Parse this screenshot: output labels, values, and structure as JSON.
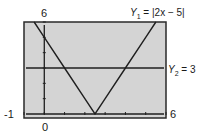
{
  "chart_data": {
    "type": "line",
    "title": "",
    "xlabel": "",
    "ylabel": "",
    "xlim": [
      -1,
      6
    ],
    "ylim": [
      0,
      6
    ],
    "grid": false,
    "tick_labels": {
      "y_max": "6",
      "x_min": "-1",
      "x_max": "6",
      "origin": "0"
    },
    "series": [
      {
        "name": "Y1 = |2x - 5|",
        "label_prefix": "Y",
        "label_sub": "1",
        "label_rest": " = |2x − 5|",
        "expression": "abs(2*x-5)",
        "x": [
          -0.5,
          0,
          1,
          2,
          2.5,
          3,
          4,
          5,
          5.5
        ],
        "y": [
          6,
          5,
          3,
          1,
          0,
          1,
          3,
          5,
          6
        ]
      },
      {
        "name": "Y2 = 3",
        "label_prefix": "Y",
        "label_sub": "2",
        "label_rest": " = 3",
        "expression": "3",
        "x": [
          -1,
          6
        ],
        "y": [
          3,
          3
        ]
      }
    ],
    "intersections": [
      [
        1,
        3
      ],
      [
        4,
        3
      ]
    ],
    "legend_position": "right-annotations"
  },
  "colors": {
    "plot_background": "#d4d4d4",
    "frame": "#2a2a2a",
    "line": "#1f1f1f"
  }
}
